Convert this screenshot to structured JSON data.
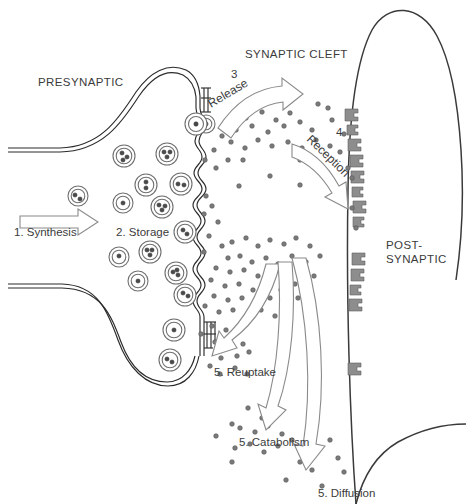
{
  "diagram": {
    "title_regions": {
      "presynaptic": "PRESYNAPTIC",
      "synaptic_cleft": "SYNAPTIC CLEFT",
      "postsynaptic_line1": "POST-",
      "postsynaptic_line2": "SYNAPTIC"
    },
    "steps": {
      "synthesis": "1. Synthesis",
      "storage": "2. Storage",
      "release_number": "3",
      "release": "Release",
      "reception_number": "4",
      "reception": "Reception",
      "reuptake": "5. Reuptake",
      "catabolism": "5. Catabolism",
      "diffusion": "5. Diffusion"
    },
    "colors": {
      "background": "#ffffff",
      "membrane": "#2b2b2b",
      "postsynaptic_membrane": "#3a3a3a",
      "vesicle_outline": "#6f6f6f",
      "vesicle_dot": "#4a4a4a",
      "neurotransmitter_dot": "#7b7b7b",
      "arrow_outline": "#8a8a8a",
      "receptor": "#8d8d8d",
      "text": "#3b3b3b"
    },
    "vesicles": [
      {
        "cx": 78,
        "cy": 196,
        "r": 10,
        "dots": [
          [
            -3,
            -1
          ],
          [
            2,
            3
          ]
        ]
      },
      {
        "cx": 124,
        "cy": 156,
        "r": 11,
        "dots": [
          [
            -2,
            -3
          ],
          [
            3,
            1
          ],
          [
            -1,
            4
          ]
        ]
      },
      {
        "cx": 167,
        "cy": 154,
        "r": 11,
        "dots": [
          [
            -3,
            -2
          ],
          [
            3,
            -2
          ],
          [
            0,
            3
          ]
        ]
      },
      {
        "cx": 146,
        "cy": 185,
        "r": 11,
        "dots": [
          [
            0,
            -3
          ],
          [
            0,
            3
          ]
        ]
      },
      {
        "cx": 181,
        "cy": 184,
        "r": 11,
        "dots": [
          [
            -3,
            0
          ],
          [
            3,
            1
          ]
        ]
      },
      {
        "cx": 123,
        "cy": 203,
        "r": 10,
        "dots": [
          [
            0,
            0
          ]
        ]
      },
      {
        "cx": 162,
        "cy": 207,
        "r": 11,
        "dots": [
          [
            -3,
            -2
          ],
          [
            3,
            -1
          ],
          [
            0,
            3
          ]
        ]
      },
      {
        "cx": 185,
        "cy": 232,
        "r": 11,
        "dots": [
          [
            -2,
            -2
          ],
          [
            2,
            2
          ]
        ]
      },
      {
        "cx": 150,
        "cy": 252,
        "r": 11,
        "dots": [
          [
            -3,
            -2
          ],
          [
            2,
            -2
          ],
          [
            0,
            3
          ]
        ]
      },
      {
        "cx": 119,
        "cy": 257,
        "r": 10,
        "dots": [
          [
            0,
            -1
          ]
        ]
      },
      {
        "cx": 176,
        "cy": 273,
        "r": 11,
        "dots": [
          [
            -3,
            -1
          ],
          [
            2,
            2
          ],
          [
            1,
            -3
          ]
        ]
      },
      {
        "cx": 138,
        "cy": 281,
        "r": 10,
        "dots": [
          [
            0,
            0
          ]
        ]
      },
      {
        "cx": 185,
        "cy": 295,
        "r": 11,
        "dots": [
          [
            -2,
            -2
          ],
          [
            3,
            1
          ]
        ]
      },
      {
        "cx": 174,
        "cy": 330,
        "r": 11,
        "dots": [
          [
            0,
            0
          ]
        ]
      },
      {
        "cx": 170,
        "cy": 360,
        "r": 11,
        "dots": [
          [
            -3,
            -1
          ],
          [
            2,
            2
          ]
        ]
      },
      {
        "cx": 206,
        "cy": 124,
        "r": 9,
        "dots": [
          [
            0,
            0
          ]
        ]
      }
    ],
    "neurotransmitter_dots": [
      [
        246,
        118
      ],
      [
        262,
        112
      ],
      [
        276,
        120
      ],
      [
        290,
        113
      ],
      [
        236,
        130
      ],
      [
        252,
        126
      ],
      [
        268,
        132
      ],
      [
        284,
        126
      ],
      [
        300,
        122
      ],
      [
        312,
        130
      ],
      [
        231,
        142
      ],
      [
        245,
        148
      ],
      [
        258,
        140
      ],
      [
        272,
        146
      ],
      [
        288,
        142
      ],
      [
        302,
        148
      ],
      [
        316,
        140
      ],
      [
        330,
        146
      ],
      [
        222,
        136
      ],
      [
        214,
        150
      ],
      [
        228,
        160
      ],
      [
        205,
        160
      ],
      [
        216,
        168
      ],
      [
        243,
        160
      ],
      [
        300,
        160
      ],
      [
        239,
        186
      ],
      [
        270,
        176
      ],
      [
        300,
        185
      ],
      [
        332,
        120
      ],
      [
        344,
        134
      ],
      [
        340,
        152
      ],
      [
        348,
        168
      ],
      [
        352,
        178
      ],
      [
        328,
        108
      ],
      [
        318,
        104
      ],
      [
        206,
        196
      ],
      [
        212,
        206
      ],
      [
        204,
        214
      ],
      [
        218,
        222
      ],
      [
        209,
        236
      ],
      [
        222,
        246
      ],
      [
        204,
        252
      ],
      [
        232,
        242
      ],
      [
        246,
        238
      ],
      [
        258,
        246
      ],
      [
        270,
        240
      ],
      [
        284,
        244
      ],
      [
        296,
        238
      ],
      [
        310,
        246
      ],
      [
        228,
        258
      ],
      [
        240,
        256
      ],
      [
        252,
        262
      ],
      [
        266,
        258
      ],
      [
        278,
        264
      ],
      [
        292,
        256
      ],
      [
        306,
        262
      ],
      [
        320,
        256
      ],
      [
        216,
        268
      ],
      [
        230,
        272
      ],
      [
        244,
        270
      ],
      [
        258,
        276
      ],
      [
        272,
        270
      ],
      [
        286,
        276
      ],
      [
        300,
        270
      ],
      [
        314,
        276
      ],
      [
        211,
        280
      ],
      [
        225,
        286
      ],
      [
        239,
        284
      ],
      [
        253,
        290
      ],
      [
        267,
        284
      ],
      [
        281,
        290
      ],
      [
        295,
        284
      ],
      [
        309,
        290
      ],
      [
        214,
        296
      ],
      [
        228,
        300
      ],
      [
        242,
        298
      ],
      [
        256,
        304
      ],
      [
        270,
        298
      ],
      [
        284,
        304
      ],
      [
        298,
        298
      ],
      [
        205,
        306
      ],
      [
        219,
        312
      ],
      [
        233,
        310
      ],
      [
        247,
        316
      ],
      [
        261,
        310
      ],
      [
        275,
        316
      ],
      [
        289,
        310
      ],
      [
        212,
        326
      ],
      [
        226,
        330
      ],
      [
        201,
        334
      ],
      [
        215,
        342
      ],
      [
        229,
        338
      ],
      [
        243,
        344
      ],
      [
        237,
        356
      ],
      [
        249,
        352
      ],
      [
        221,
        358
      ],
      [
        210,
        366
      ],
      [
        235,
        368
      ],
      [
        220,
        374
      ],
      [
        247,
        374
      ],
      [
        352,
        208
      ],
      [
        356,
        228
      ],
      [
        248,
        408
      ],
      [
        262,
        418
      ],
      [
        275,
        412
      ],
      [
        240,
        428
      ],
      [
        255,
        432
      ],
      [
        268,
        426
      ],
      [
        282,
        434
      ],
      [
        235,
        448
      ],
      [
        250,
        444
      ],
      [
        264,
        452
      ],
      [
        278,
        446
      ],
      [
        292,
        440
      ],
      [
        232,
        462
      ],
      [
        300,
        462
      ],
      [
        312,
        470
      ],
      [
        286,
        480
      ],
      [
        322,
        486
      ],
      [
        338,
        458
      ],
      [
        330,
        440
      ],
      [
        344,
        472
      ],
      [
        232,
        424
      ],
      [
        216,
        436
      ]
    ],
    "receptors": [
      {
        "x": 348,
        "y": 114
      },
      {
        "x": 350,
        "y": 128
      },
      {
        "x": 352,
        "y": 142
      },
      {
        "x": 354,
        "y": 156
      },
      {
        "x": 356,
        "y": 170
      },
      {
        "x": 357,
        "y": 184
      },
      {
        "x": 358,
        "y": 198
      },
      {
        "x": 359,
        "y": 212
      },
      {
        "x": 358,
        "y": 248
      },
      {
        "x": 357,
        "y": 262
      },
      {
        "x": 356,
        "y": 276
      },
      {
        "x": 355,
        "y": 290
      },
      {
        "x": 354,
        "y": 304
      },
      {
        "x": 350,
        "y": 368
      }
    ]
  }
}
